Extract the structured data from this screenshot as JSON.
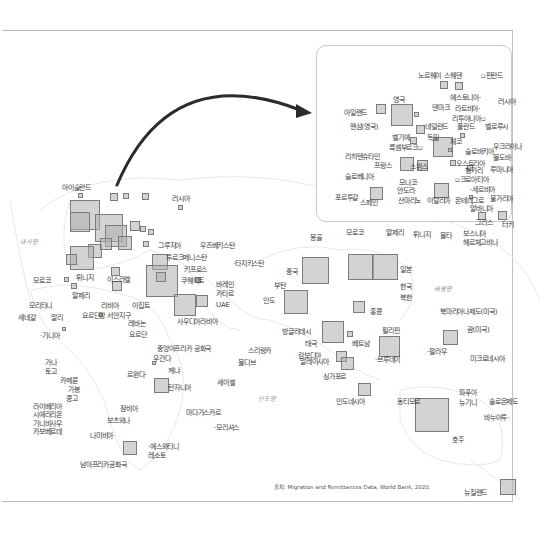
{
  "figure": {
    "source": "출처: Migration and Remittances Data, World Bank, 2020.",
    "ocean_labels": [
      {
        "text": "대서양",
        "x": 20,
        "y": 238
      },
      {
        "text": "인도양",
        "x": 258,
        "y": 395
      },
      {
        "text": "태평양",
        "x": 434,
        "y": 285
      }
    ],
    "world_labels": [
      {
        "text": "아이슬란드",
        "x": 62,
        "y": 184
      },
      {
        "text": "러시아",
        "x": 172,
        "y": 195
      },
      {
        "text": "그루지아",
        "x": 158,
        "y": 242
      },
      {
        "text": "우즈베키스탄",
        "x": 200,
        "y": 242
      },
      {
        "text": "투르크메니스탄",
        "x": 166,
        "y": 254
      },
      {
        "text": "·타지키스탄",
        "x": 233,
        "y": 260
      },
      {
        "text": "키프로스",
        "x": 184,
        "y": 266
      },
      {
        "text": "쿠웨이트",
        "x": 181,
        "y": 277
      },
      {
        "text": "바레인",
        "x": 216,
        "y": 281
      },
      {
        "text": "카타르",
        "x": 216,
        "y": 290
      },
      {
        "text": "UAE",
        "x": 216,
        "y": 301
      },
      {
        "text": "사우디아라비아",
        "x": 177,
        "y": 318
      },
      {
        "text": "몽골",
        "x": 310,
        "y": 234
      },
      {
        "text": "중국",
        "x": 286,
        "y": 268
      },
      {
        "text": "부탄",
        "x": 274,
        "y": 282
      },
      {
        "text": "인도",
        "x": 263,
        "y": 297
      },
      {
        "text": "방글라데시",
        "x": 282,
        "y": 328
      },
      {
        "text": "일본",
        "x": 400,
        "y": 266
      },
      {
        "text": "한국",
        "x": 400,
        "y": 283
      },
      {
        "text": "북한",
        "x": 400,
        "y": 294
      },
      {
        "text": "홍콩",
        "x": 370,
        "y": 308
      },
      {
        "text": "필리핀",
        "x": 382,
        "y": 327
      },
      {
        "text": "태국",
        "x": 305,
        "y": 340
      },
      {
        "text": "캄보디아",
        "x": 298,
        "y": 352
      },
      {
        "text": "베트남",
        "x": 352,
        "y": 340
      },
      {
        "text": "말레이시아",
        "x": 300,
        "y": 358
      },
      {
        "text": "·브루네이",
        "x": 375,
        "y": 356
      },
      {
        "text": "싱가포르",
        "x": 323,
        "y": 373
      },
      {
        "text": "인도네시아",
        "x": 336,
        "y": 398
      },
      {
        "text": "동티모르",
        "x": 397,
        "y": 398
      },
      {
        "text": "북마리아나제도(미국)",
        "x": 440,
        "y": 308
      },
      {
        "text": "괌(미국)",
        "x": 467,
        "y": 326
      },
      {
        "text": "·팔라우",
        "x": 427,
        "y": 348
      },
      {
        "text": "미크로네시아",
        "x": 470,
        "y": 355
      },
      {
        "text": "파푸아",
        "x": 459,
        "y": 389
      },
      {
        "text": "뉴기니",
        "x": 459,
        "y": 399
      },
      {
        "text": "솔로몬제도",
        "x": 489,
        "y": 398
      },
      {
        "text": "바누아투·",
        "x": 484,
        "y": 414
      },
      {
        "text": "호주",
        "x": 452,
        "y": 436
      },
      {
        "text": "뉴질랜드",
        "x": 464,
        "y": 489
      },
      {
        "text": "모로코",
        "x": 33,
        "y": 277
      },
      {
        "text": "튀니지",
        "x": 76,
        "y": 274
      },
      {
        "text": "이스라엘",
        "x": 107,
        "y": 276
      },
      {
        "text": "알제리",
        "x": 72,
        "y": 292
      },
      {
        "text": "리비아",
        "x": 101,
        "y": 302
      },
      {
        "text": "이집트",
        "x": 132,
        "y": 302
      },
      {
        "text": "모리타니",
        "x": 29,
        "y": 302
      },
      {
        "text": "세네갈",
        "x": 18,
        "y": 314
      },
      {
        "text": "말리",
        "x": 51,
        "y": 314
      },
      {
        "text": "요르단강 서안지구",
        "x": 82,
        "y": 312
      },
      {
        "text": "레바논",
        "x": 128,
        "y": 320
      },
      {
        "text": "요르단",
        "x": 129,
        "y": 331
      },
      {
        "text": "·기니아",
        "x": 40,
        "y": 332
      },
      {
        "text": "중앙아프리카 공화국",
        "x": 157,
        "y": 345
      },
      {
        "text": "우간다",
        "x": 153,
        "y": 355
      },
      {
        "text": "케냐",
        "x": 168,
        "y": 367
      },
      {
        "text": "스리랑카",
        "x": 248,
        "y": 347
      },
      {
        "text": "몰디브",
        "x": 238,
        "y": 359
      },
      {
        "text": "가나",
        "x": 45,
        "y": 359
      },
      {
        "text": "토고",
        "x": 45,
        "y": 368
      },
      {
        "text": "르완다·",
        "x": 127,
        "y": 371
      },
      {
        "text": "탄자니아",
        "x": 168,
        "y": 384
      },
      {
        "text": "세이셸",
        "x": 217,
        "y": 379
      },
      {
        "text": "카메룬",
        "x": 60,
        "y": 377
      },
      {
        "text": "가봉",
        "x": 68,
        "y": 386
      },
      {
        "text": "콩고",
        "x": 66,
        "y": 395
      },
      {
        "text": "라이베리아",
        "x": 33,
        "y": 403
      },
      {
        "text": "시에라리온",
        "x": 33,
        "y": 411
      },
      {
        "text": "기니비사우",
        "x": 33,
        "y": 420
      },
      {
        "text": "카보베르데",
        "x": 33,
        "y": 428
      },
      {
        "text": "잠비아",
        "x": 120,
        "y": 405
      },
      {
        "text": "보츠와나",
        "x": 107,
        "y": 417
      },
      {
        "text": "나미비아",
        "x": 90,
        "y": 432
      },
      {
        "text": "마다가스카르",
        "x": 186,
        "y": 409
      },
      {
        "text": "·모리셔스",
        "x": 214,
        "y": 424
      },
      {
        "text": "·에스와티니",
        "x": 148,
        "y": 443
      },
      {
        "text": "레소토",
        "x": 148,
        "y": 452
      },
      {
        "text": "남아프리카공화국",
        "x": 80,
        "y": 461
      }
    ],
    "inset_labels": [
      {
        "text": "노르웨이",
        "x": 418,
        "y": 72
      },
      {
        "text": "스웨덴",
        "x": 444,
        "y": 72
      },
      {
        "text": "▫핀란드",
        "x": 481,
        "y": 72
      },
      {
        "text": "영국",
        "x": 393,
        "y": 96
      },
      {
        "text": "에스토니아·",
        "x": 450,
        "y": 94
      },
      {
        "text": "러시아",
        "x": 498,
        "y": 98
      },
      {
        "text": "아일랜드",
        "x": 344,
        "y": 109
      },
      {
        "text": "덴마크",
        "x": 432,
        "y": 104
      },
      {
        "text": "라트비아·",
        "x": 455,
        "y": 105
      },
      {
        "text": "리투아니아▫",
        "x": 452,
        "y": 115
      },
      {
        "text": "맨섬(영국)",
        "x": 350,
        "y": 123
      },
      {
        "text": "네덜란드",
        "x": 425,
        "y": 123
      },
      {
        "text": "폴란드",
        "x": 457,
        "y": 123
      },
      {
        "text": "벨로루시",
        "x": 485,
        "y": 123
      },
      {
        "text": "벨기에",
        "x": 392,
        "y": 134
      },
      {
        "text": "독일",
        "x": 427,
        "y": 134
      },
      {
        "text": "룩셈부르크▫",
        "x": 389,
        "y": 144
      },
      {
        "text": "체코",
        "x": 450,
        "y": 138
      },
      {
        "text": "슬로바키아",
        "x": 465,
        "y": 148
      },
      {
        "text": "우크라이나",
        "x": 493,
        "y": 143
      },
      {
        "text": "리히텐슈타인",
        "x": 345,
        "y": 153
      },
      {
        "text": "몰도바",
        "x": 493,
        "y": 154
      },
      {
        "text": "프랑스",
        "x": 374,
        "y": 162
      },
      {
        "text": "스위스",
        "x": 410,
        "y": 163
      },
      {
        "text": "오스트리아",
        "x": 456,
        "y": 160
      },
      {
        "text": "헝가리",
        "x": 465,
        "y": 167
      },
      {
        "text": "루마니아",
        "x": 490,
        "y": 166
      },
      {
        "text": "슬로베니아",
        "x": 345,
        "y": 173
      },
      {
        "text": "▫크로아티아",
        "x": 455,
        "y": 176
      },
      {
        "text": "모나코·",
        "x": 399,
        "y": 179
      },
      {
        "text": "안도라",
        "x": 397,
        "y": 187
      },
      {
        "text": "·세르비아",
        "x": 470,
        "y": 186
      },
      {
        "text": "불가리아",
        "x": 490,
        "y": 195
      },
      {
        "text": "포르투갈",
        "x": 335,
        "y": 194
      },
      {
        "text": "스페인",
        "x": 360,
        "y": 199
      },
      {
        "text": "산마리노",
        "x": 398,
        "y": 197
      },
      {
        "text": "이탈리아",
        "x": 427,
        "y": 197
      },
      {
        "text": "몬테네그로",
        "x": 455,
        "y": 197
      },
      {
        "text": "알바니아",
        "x": 470,
        "y": 205
      },
      {
        "text": "그리스",
        "x": 475,
        "y": 219
      },
      {
        "text": "터키",
        "x": 502,
        "y": 221
      },
      {
        "text": "모로코",
        "x": 346,
        "y": 229
      },
      {
        "text": "알제리",
        "x": 386,
        "y": 229
      },
      {
        "text": "튀니지",
        "x": 413,
        "y": 231
      },
      {
        "text": "몰타",
        "x": 440,
        "y": 232
      },
      {
        "text": "보스니아",
        "x": 463,
        "y": 230
      },
      {
        "text": "헤르체고비나",
        "x": 463,
        "y": 239
      }
    ],
    "squares": [
      {
        "x": 78,
        "y": 193,
        "s": 5
      },
      {
        "x": 110,
        "y": 193,
        "s": 8
      },
      {
        "x": 123,
        "y": 193,
        "s": 6
      },
      {
        "x": 142,
        "y": 193,
        "s": 7
      },
      {
        "x": 178,
        "y": 205,
        "s": 5
      },
      {
        "x": 70,
        "y": 200,
        "s": 30
      },
      {
        "x": 70,
        "y": 212,
        "s": 20
      },
      {
        "x": 95,
        "y": 214,
        "s": 28
      },
      {
        "x": 105,
        "y": 225,
        "s": 22
      },
      {
        "x": 88,
        "y": 244,
        "s": 14
      },
      {
        "x": 70,
        "y": 246,
        "s": 24
      },
      {
        "x": 100,
        "y": 238,
        "s": 12
      },
      {
        "x": 118,
        "y": 236,
        "s": 14
      },
      {
        "x": 130,
        "y": 221,
        "s": 10
      },
      {
        "x": 140,
        "y": 226,
        "s": 6
      },
      {
        "x": 148,
        "y": 229,
        "s": 6
      },
      {
        "x": 143,
        "y": 241,
        "s": 6
      },
      {
        "x": 66,
        "y": 254,
        "s": 11
      },
      {
        "x": 152,
        "y": 254,
        "s": 16
      },
      {
        "x": 146,
        "y": 265,
        "s": 32
      },
      {
        "x": 156,
        "y": 272,
        "s": 10
      },
      {
        "x": 174,
        "y": 294,
        "s": 22
      },
      {
        "x": 196,
        "y": 295,
        "s": 12
      },
      {
        "x": 195,
        "y": 277,
        "s": 6
      },
      {
        "x": 64,
        "y": 277,
        "s": 5
      },
      {
        "x": 71,
        "y": 283,
        "s": 6
      },
      {
        "x": 111,
        "y": 267,
        "s": 9
      },
      {
        "x": 112,
        "y": 281,
        "s": 10
      },
      {
        "x": 302,
        "y": 257,
        "s": 27
      },
      {
        "x": 284,
        "y": 290,
        "s": 24
      },
      {
        "x": 348,
        "y": 254,
        "s": 26
      },
      {
        "x": 372,
        "y": 254,
        "s": 26
      },
      {
        "x": 353,
        "y": 301,
        "s": 12
      },
      {
        "x": 379,
        "y": 336,
        "s": 21
      },
      {
        "x": 322,
        "y": 321,
        "s": 22
      },
      {
        "x": 347,
        "y": 331,
        "s": 6
      },
      {
        "x": 336,
        "y": 351,
        "s": 11
      },
      {
        "x": 341,
        "y": 357,
        "s": 13
      },
      {
        "x": 358,
        "y": 383,
        "s": 13
      },
      {
        "x": 443,
        "y": 330,
        "s": 15
      },
      {
        "x": 415,
        "y": 398,
        "s": 34
      },
      {
        "x": 500,
        "y": 479,
        "s": 16
      },
      {
        "x": 152,
        "y": 361,
        "s": 4
      },
      {
        "x": 154,
        "y": 378,
        "s": 15
      },
      {
        "x": 123,
        "y": 441,
        "s": 14
      },
      {
        "x": 62,
        "y": 327,
        "s": 4
      },
      {
        "x": 99,
        "y": 313,
        "s": 4
      },
      {
        "x": 440,
        "y": 81,
        "s": 8
      },
      {
        "x": 455,
        "y": 82,
        "s": 8
      },
      {
        "x": 376,
        "y": 104,
        "s": 10
      },
      {
        "x": 391,
        "y": 104,
        "s": 22
      },
      {
        "x": 414,
        "y": 112,
        "s": 5
      },
      {
        "x": 416,
        "y": 125,
        "s": 9
      },
      {
        "x": 433,
        "y": 137,
        "s": 20
      },
      {
        "x": 410,
        "y": 137,
        "s": 7
      },
      {
        "x": 460,
        "y": 133,
        "s": 5
      },
      {
        "x": 448,
        "y": 148,
        "s": 4
      },
      {
        "x": 400,
        "y": 157,
        "s": 14
      },
      {
        "x": 417,
        "y": 160,
        "s": 11
      },
      {
        "x": 450,
        "y": 160,
        "s": 6
      },
      {
        "x": 467,
        "y": 165,
        "s": 6
      },
      {
        "x": 370,
        "y": 187,
        "s": 13
      },
      {
        "x": 434,
        "y": 183,
        "s": 15
      },
      {
        "x": 478,
        "y": 212,
        "s": 8
      },
      {
        "x": 498,
        "y": 211,
        "s": 9
      },
      {
        "x": 469,
        "y": 195,
        "s": 4
      }
    ]
  }
}
